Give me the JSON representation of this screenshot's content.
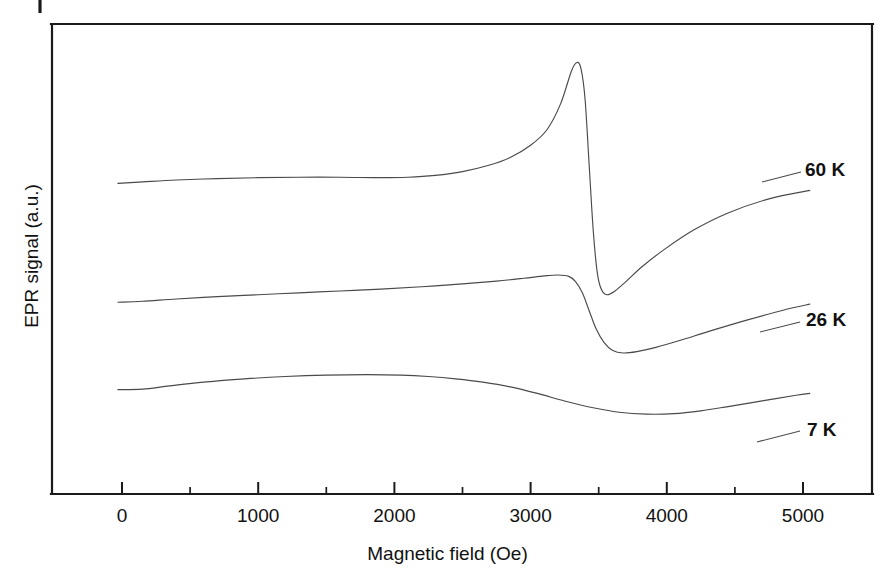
{
  "chart_data": {
    "type": "line",
    "title": "",
    "xlabel": "Magnetic field (Oe)",
    "ylabel": "EPR signal (a.u.)",
    "xlim": [
      -450,
      5500
    ],
    "ylim": [
      0,
      1
    ],
    "grid": false,
    "legend_position": "right-inline",
    "xticks": [
      0,
      1000,
      2000,
      3000,
      4000,
      5000
    ],
    "xticklabels": [
      "0",
      "1000",
      "2000",
      "3000",
      "4000",
      "5000"
    ],
    "xminorticks": [
      500,
      1500,
      2500,
      3500,
      4500
    ],
    "yticks": [],
    "yticklabels": [],
    "series": [
      {
        "name": "60 K",
        "label": "60 K",
        "description": "Derivative EPR lineshape with sharp resonance: slowly rising baseline, sharp maximum near 3340 Oe, steep zero crossing near 3430 Oe, deep minimum near 3500 Oe, then recovery toward baseline.",
        "x": [
          -30,
          150,
          400,
          700,
          1000,
          1300,
          1600,
          1900,
          2100,
          2300,
          2500,
          2700,
          2850,
          3000,
          3120,
          3220,
          3300,
          3340,
          3370,
          3400,
          3430,
          3460,
          3490,
          3520,
          3560,
          3620,
          3700,
          3820,
          3980,
          4200,
          4450,
          4750,
          5050
        ],
        "y": [
          0.661,
          0.664,
          0.668,
          0.671,
          0.673,
          0.674,
          0.674,
          0.673,
          0.674,
          0.678,
          0.686,
          0.7,
          0.716,
          0.742,
          0.775,
          0.83,
          0.9,
          0.918,
          0.905,
          0.84,
          0.7,
          0.56,
          0.47,
          0.435,
          0.424,
          0.432,
          0.452,
          0.484,
          0.52,
          0.562,
          0.598,
          0.628,
          0.646
        ]
      },
      {
        "name": "26 K",
        "label": "26 K",
        "description": "Broader derivative lineshape: gently rising baseline with rounded shoulder near 3200 Oe, smooth descent through zero near 3400 Oe, rounded minimum near 3620 Oe, slow recovery.",
        "x": [
          -30,
          150,
          400,
          700,
          1000,
          1300,
          1600,
          1900,
          2200,
          2500,
          2750,
          2950,
          3100,
          3200,
          3280,
          3330,
          3380,
          3430,
          3480,
          3540,
          3600,
          3680,
          3780,
          3920,
          4100,
          4320,
          4600,
          4880,
          5050
        ],
        "y": [
          0.408,
          0.41,
          0.415,
          0.42,
          0.424,
          0.428,
          0.432,
          0.436,
          0.441,
          0.447,
          0.453,
          0.459,
          0.464,
          0.466,
          0.463,
          0.452,
          0.428,
          0.39,
          0.352,
          0.322,
          0.306,
          0.3,
          0.303,
          0.312,
          0.327,
          0.347,
          0.371,
          0.393,
          0.404
        ]
      },
      {
        "name": "7 K",
        "label": "7 K",
        "description": "Very broad, shallow derivative lineshape: wide rounded maximum near 1800 Oe, slow descent, broad shallow minimum near 3900 Oe, gradual rise toward 5000 Oe.",
        "x": [
          -30,
          150,
          350,
          600,
          900,
          1200,
          1500,
          1800,
          2050,
          2250,
          2450,
          2650,
          2850,
          3050,
          3250,
          3450,
          3650,
          3850,
          4050,
          4250,
          4450,
          4700,
          4950,
          5050
        ],
        "y": [
          0.222,
          0.223,
          0.23,
          0.238,
          0.245,
          0.25,
          0.253,
          0.254,
          0.253,
          0.25,
          0.245,
          0.238,
          0.228,
          0.214,
          0.198,
          0.184,
          0.174,
          0.17,
          0.171,
          0.177,
          0.186,
          0.198,
          0.21,
          0.214
        ]
      }
    ]
  },
  "axes": {
    "xlabel": "Magnetic field (Oe)",
    "ylabel": "EPR signal (a.u.)",
    "xticklabels": [
      "0",
      "1000",
      "2000",
      "3000",
      "4000",
      "5000"
    ]
  },
  "labels": {
    "series_60k": "60 K",
    "series_26k": "26 K",
    "series_7k": "7 K"
  }
}
